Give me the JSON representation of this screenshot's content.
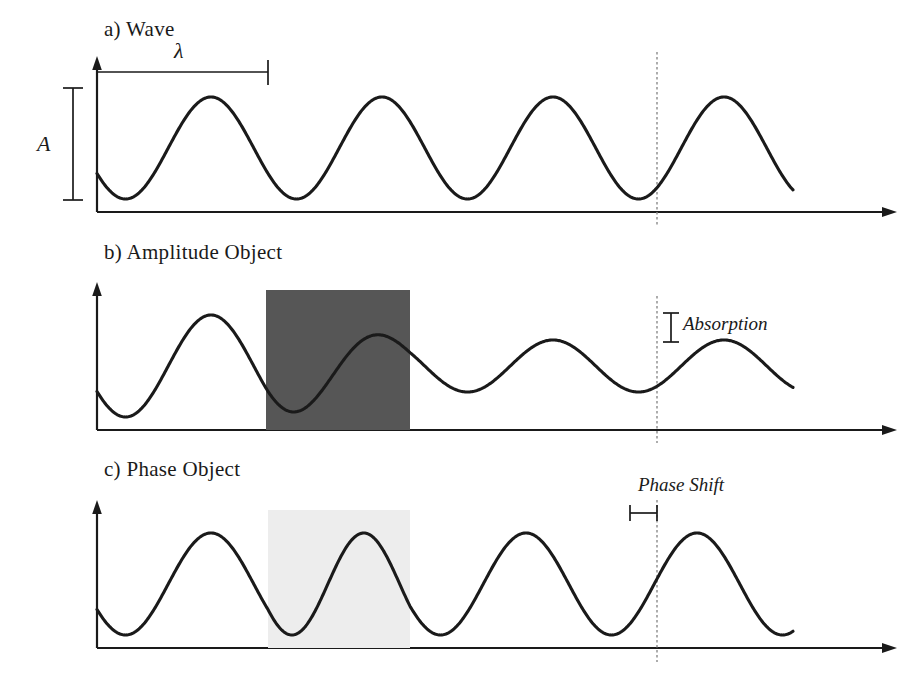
{
  "figure": {
    "background_color": "#ffffff",
    "ink_color": "#1a1a1a",
    "absorber_color": "#565656",
    "phase_plate_color": "#ededed"
  },
  "panels": [
    {
      "id": "wave",
      "title": "a) Wave",
      "annotations": {
        "wavelength_symbol": "λ",
        "amplitude_symbol": "A"
      },
      "axis": {
        "origin_x": 97,
        "baseline_y": 212,
        "arrow_top_y": 60,
        "arrow_right_x": 897
      },
      "wave": {
        "baseline_y": 212,
        "peak_y": 97,
        "trough_y": 200,
        "amplitude_px": 51,
        "center_y": 148,
        "wavelength_px": 171,
        "start_x": 97,
        "end_x": 793,
        "start_phase_deg": 210
      },
      "markers": {
        "wavelength_bracket": {
          "x1": 97,
          "x2": 268,
          "y": 72
        },
        "amplitude_bracket": {
          "x": 73,
          "y1": 88,
          "y2": 200
        },
        "dashed_line_x": 657
      }
    },
    {
      "id": "amplitude-object",
      "title": "b) Amplitude Object",
      "annotations": {
        "effect_label": "Absorption"
      },
      "axis": {
        "origin_x": 97,
        "baseline_y": 430,
        "arrow_top_y": 285,
        "arrow_right_x": 897
      },
      "wave": {
        "baseline_y": 430,
        "center_y": 366,
        "amplitude_before_px": 51,
        "amplitude_after_px": 26,
        "wavelength_px": 171,
        "start_x": 97,
        "end_x": 793,
        "start_phase_deg": 210
      },
      "object": {
        "type": "absorber",
        "x": 266,
        "y": 290,
        "width": 144,
        "height": 140,
        "color": "#565656"
      },
      "markers": {
        "absorption_bracket": {
          "x": 671,
          "y1": 313,
          "y2": 342
        },
        "label_x": 681,
        "label_y": 316,
        "dashed_line_x": 657
      }
    },
    {
      "id": "phase-object",
      "title": "c) Phase Object",
      "annotations": {
        "effect_label": "Phase Shift"
      },
      "axis": {
        "origin_x": 97,
        "baseline_y": 648,
        "arrow_top_y": 503,
        "arrow_right_x": 897
      },
      "wave": {
        "baseline_y": 648,
        "peak_y": 533,
        "trough_y": 636,
        "center_y": 584,
        "amplitude_px": 51,
        "wavelength_px": 171,
        "start_x": 97,
        "end_x": 793,
        "start_phase_deg": 210,
        "phase_shift_px": 27
      },
      "object": {
        "type": "phase-plate",
        "x": 268,
        "y": 510,
        "width": 142,
        "height": 138,
        "color": "#ededed"
      },
      "markers": {
        "phase_shift_bracket": {
          "x1": 630,
          "x2": 657,
          "y": 513
        },
        "label_x": 640,
        "label_y": 478,
        "dashed_line_x": 657
      }
    }
  ]
}
